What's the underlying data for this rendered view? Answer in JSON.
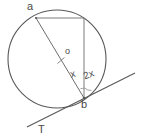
{
  "figure": {
    "kind": "circle-tangent-geometry-diagram",
    "background_color": "#ffffff",
    "stroke_color": "#585858",
    "label_color": "#4a4a4a",
    "labels": {
      "point_a": "a",
      "point_b": "b",
      "center_o": "o",
      "tangent_T": "T",
      "angle_x": "x",
      "angle_2x": "2x"
    },
    "geometry": {
      "circle": {
        "cx": 57,
        "cy": 59,
        "r": 49
      },
      "point_a": {
        "x": 36,
        "y": 18
      },
      "point_b": {
        "x": 84,
        "y": 98
      },
      "point_c": {
        "x": 84,
        "y": 18
      },
      "center": {
        "x": 57,
        "y": 59
      },
      "tangent_start": {
        "x": 27,
        "y": 127
      },
      "tangent_end": {
        "x": 135,
        "y": 73
      }
    }
  }
}
